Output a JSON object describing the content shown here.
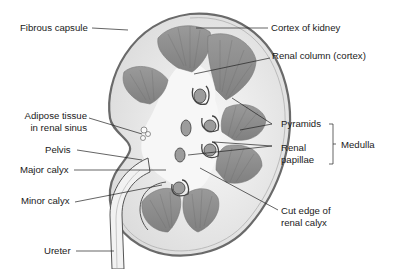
{
  "labels": {
    "fibrous_capsule": "Fibrous capsule",
    "cortex_of_kidney": "Cortex of kidney",
    "renal_column": "Renal column (cortex)",
    "adipose_line1": "Adipose tissue",
    "adipose_line2": "in renal sinus",
    "pyramids": "Pyramids",
    "medulla": "Medulla",
    "renal_papillae_line1": "Renal",
    "renal_papillae_line2": "papillae",
    "pelvis": "Pelvis",
    "major_calyx": "Major calyx",
    "minor_calyx": "Minor calyx",
    "cut_edge_line1": "Cut edge of",
    "cut_edge_line2": "renal calyx",
    "ureter": "Ureter"
  },
  "colors": {
    "capsule": "#7a7a7a",
    "cortex": "#ececec",
    "pyramid": "#8e8e8e",
    "pyramid_stripe": "#6e6e6e",
    "sinus": "#f6f6f6",
    "line": "#222222"
  }
}
